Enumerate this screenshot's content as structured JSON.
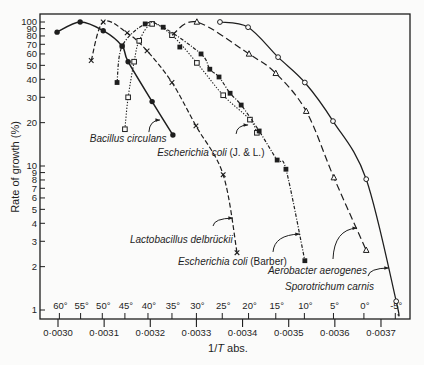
{
  "chart_data": {
    "type": "line",
    "title": "",
    "xlabel": "1/T abs.",
    "xlabel_parts": {
      "pre": "1/",
      "italic": "T",
      "post": " abs."
    },
    "ylabel": "Rate of growth (%)",
    "xscale": "linear",
    "yscale": "log",
    "xlim": [
      0.00296,
      0.003763
    ],
    "ylim": [
      0.87,
      114
    ],
    "grid": false,
    "legend": "none (curves labelled directly with arrows)",
    "x_ticks": [
      {
        "value": 0.003,
        "label": "0·0030"
      },
      {
        "value": 0.0031,
        "label": "0·0031"
      },
      {
        "value": 0.0032,
        "label": "0·0032"
      },
      {
        "value": 0.0033,
        "label": "0·0033"
      },
      {
        "value": 0.0034,
        "label": "0·0034"
      },
      {
        "value": 0.0035,
        "label": "0·0035"
      },
      {
        "value": 0.0036,
        "label": "0·0036"
      },
      {
        "value": 0.0037,
        "label": "0·0037"
      }
    ],
    "y_ticks": [
      {
        "value": 100,
        "label": "100"
      },
      {
        "value": 90,
        "label": "90"
      },
      {
        "value": 80,
        "label": "80"
      },
      {
        "value": 70,
        "label": "70"
      },
      {
        "value": 60,
        "label": "60"
      },
      {
        "value": 50,
        "label": "50"
      },
      {
        "value": 40,
        "label": "40"
      },
      {
        "value": 30,
        "label": "30"
      },
      {
        "value": 20,
        "label": "20"
      },
      {
        "value": 10,
        "label": "10"
      },
      {
        "value": 9,
        "label": "9"
      },
      {
        "value": 8,
        "label": "8"
      },
      {
        "value": 7,
        "label": "7"
      },
      {
        "value": 6,
        "label": "6"
      },
      {
        "value": 5,
        "label": "5"
      },
      {
        "value": 4,
        "label": "4"
      },
      {
        "value": 3,
        "label": "3"
      },
      {
        "value": 2,
        "label": "2"
      },
      {
        "value": 1,
        "label": "1"
      }
    ],
    "temperature_ticks": [
      {
        "celsius": 60,
        "inv_T": 0.003003,
        "label": "60°"
      },
      {
        "celsius": 55,
        "inv_T": 0.003049,
        "label": "55°"
      },
      {
        "celsius": 50,
        "inv_T": 0.003096,
        "label": "50°"
      },
      {
        "celsius": 45,
        "inv_T": 0.003145,
        "label": "45°"
      },
      {
        "celsius": 40,
        "inv_T": 0.003195,
        "label": "40°"
      },
      {
        "celsius": 35,
        "inv_T": 0.003247,
        "label": "35°"
      },
      {
        "celsius": 30,
        "inv_T": 0.0033,
        "label": "30°"
      },
      {
        "celsius": 25,
        "inv_T": 0.003356,
        "label": "25°"
      },
      {
        "celsius": 20,
        "inv_T": 0.003413,
        "label": "20°"
      },
      {
        "celsius": 15,
        "inv_T": 0.003472,
        "label": "15°"
      },
      {
        "celsius": 10,
        "inv_T": 0.003534,
        "label": "10°"
      },
      {
        "celsius": 5,
        "inv_T": 0.003597,
        "label": "5°"
      },
      {
        "celsius": 0,
        "inv_T": 0.003663,
        "label": "0°"
      },
      {
        "celsius": -5,
        "inv_T": 0.003731,
        "label": "-5°"
      }
    ],
    "series": [
      {
        "id": "bacillus-circulans",
        "name": "Bacillus circulans",
        "marker": "filled-circle",
        "line_style": "solid",
        "points": [
          [
            0.002998,
            85
          ],
          [
            0.003048,
            100
          ],
          [
            0.003098,
            87
          ],
          [
            0.003139,
            68
          ],
          [
            0.003152,
            53
          ],
          [
            0.003204,
            28
          ],
          [
            0.003249,
            16.4
          ]
        ],
        "label": {
          "italic": "Bacillus circulans",
          "plain": "",
          "at": [
            0.003069,
            14.7
          ],
          "arrow": {
            "from": [
              0.003197,
              17.2
            ],
            "to": [
              0.003221,
              20.9
            ]
          }
        }
      },
      {
        "id": "lactobacillus-delbrueckii",
        "name": "Lactobacillus delbrückii",
        "marker": "x",
        "line_style": "dashed",
        "points": [
          [
            0.003072,
            54
          ],
          [
            0.003098,
            100
          ],
          [
            0.00315,
            84
          ],
          [
            0.003193,
            63
          ],
          [
            0.003247,
            38
          ],
          [
            0.003299,
            19
          ],
          [
            0.003358,
            8.7
          ],
          [
            0.003388,
            2.5
          ]
        ],
        "label": {
          "italic": "Lactobacillus delbrückii",
          "plain": "",
          "at": [
            0.003156,
            2.92
          ],
          "arrow": {
            "from": [
              0.003336,
              3.83
            ],
            "to": [
              0.003379,
              4.35
            ]
          }
        }
      },
      {
        "id": "escherichia-coli-jl",
        "name": "Escherichia coli (J. & L.)",
        "marker": "open-square",
        "line_style": "dotted",
        "points": [
          [
            0.003145,
            18
          ],
          [
            0.003152,
            30
          ],
          [
            0.003165,
            53
          ],
          [
            0.003176,
            74
          ],
          [
            0.003204,
            97
          ],
          [
            0.003247,
            81
          ],
          [
            0.003301,
            52
          ],
          [
            0.003358,
            31
          ],
          [
            0.003416,
            21
          ],
          [
            0.003431,
            17
          ]
        ],
        "label": {
          "italic": "Escherichia coli",
          "plain": " (J. & L.)",
          "at": [
            0.003215,
            11.7
          ],
          "arrow": {
            "from": [
              0.003386,
              16.7
            ],
            "to": [
              0.003412,
              19.3
            ]
          }
        }
      },
      {
        "id": "escherichia-coli-barber",
        "name": "Escherichia coli (Barber)",
        "marker": "filled-square",
        "line_style": "dash-dot",
        "points": [
          [
            0.003128,
            38
          ],
          [
            0.003139,
            68
          ],
          [
            0.003189,
            97
          ],
          [
            0.003228,
            92
          ],
          [
            0.003264,
            67
          ],
          [
            0.00331,
            60
          ],
          [
            0.003329,
            47
          ],
          [
            0.003349,
            41.5
          ],
          [
            0.003373,
            32
          ],
          [
            0.003397,
            26.5
          ],
          [
            0.003436,
            17.5
          ],
          [
            0.003475,
            11
          ],
          [
            0.003494,
            9.5
          ],
          [
            0.003535,
            2.2
          ]
        ],
        "curve_excludes": [
          4
        ],
        "label": {
          "italic": "Escherichia coli",
          "plain": " (Barber)",
          "at": [
            0.00326,
            2.05
          ],
          "arrow": {
            "from": [
              0.003466,
              2.53
            ],
            "to": [
              0.003524,
              3.37
            ]
          }
        }
      },
      {
        "id": "aerobacter-aerogenes",
        "name": "Aerobacter aerogenes",
        "marker": "open-triangle",
        "line_style": "long-dashed",
        "path_start": [
          0.003247,
          81
        ],
        "points": [
          [
            0.003301,
            100
          ],
          [
            0.003414,
            60
          ],
          [
            0.003472,
            44
          ],
          [
            0.003538,
            24
          ],
          [
            0.003598,
            8.3
          ],
          [
            0.003668,
            2.6
          ]
        ],
        "label": {
          "italic": "Aerobacter aerogenes",
          "plain": "",
          "at": [
            0.003455,
            1.78
          ],
          "arrow": {
            "from": [
              0.003596,
              2.26
            ],
            "to": [
              0.003648,
              3.71
            ]
          }
        }
      },
      {
        "id": "sporotrichum-carnis",
        "name": "Sporotrichum carnis",
        "marker": "open-circle",
        "line_style": "solid-thin",
        "points": [
          [
            0.003351,
            100
          ],
          [
            0.003412,
            92
          ],
          [
            0.003477,
            57
          ],
          [
            0.003535,
            38
          ],
          [
            0.003596,
            20.5
          ],
          [
            0.003668,
            8.1
          ],
          [
            0.003733,
            1.15
          ]
        ],
        "path_end": [
          0.003737,
          0.92
        ],
        "label": {
          "italic": "Sporotrichum carnis",
          "plain": "",
          "at": [
            0.003492,
            1.38
          ],
          "arrow": {
            "from": [
              0.003672,
              1.72
            ],
            "to": [
              0.003717,
              1.96
            ]
          }
        }
      }
    ]
  }
}
